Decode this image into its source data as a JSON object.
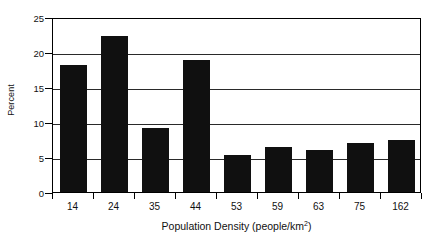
{
  "chart_data": {
    "type": "bar",
    "title": "",
    "xlabel": "Population Density (people/km2)",
    "xlabel_base": "Population Density (people/km",
    "xlabel_sup": "2",
    "xlabel_tail": ")",
    "ylabel": "Percent",
    "categories": [
      "14",
      "24",
      "35",
      "44",
      "53",
      "59",
      "63",
      "75",
      "162"
    ],
    "values": [
      18.2,
      22.3,
      9.1,
      18.9,
      5.3,
      6.4,
      6.0,
      7.0,
      7.4
    ],
    "ylim": [
      0,
      25
    ],
    "ytick_labels": [
      "0",
      "5",
      "10",
      "15",
      "20",
      "25"
    ],
    "ytick_values": [
      0,
      5,
      10,
      15,
      20,
      25
    ],
    "grid": "horizontal",
    "legend": "none",
    "bar_color": "#101010",
    "axis_color": "#000000",
    "grid_color": "#2a2a2a",
    "background": "#ffffff"
  }
}
